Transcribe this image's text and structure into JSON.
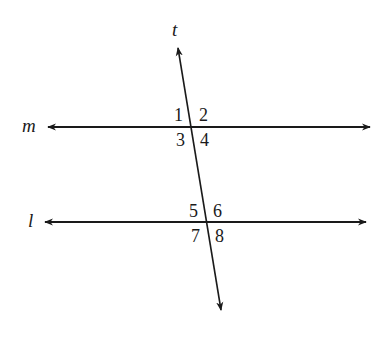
{
  "diagram": {
    "type": "parallel-lines-cut-by-transversal",
    "stroke_color": "#1a1a1a",
    "background": "#ffffff",
    "lines": {
      "transversal": {
        "name": "t"
      },
      "upper": {
        "name": "m"
      },
      "lower": {
        "name": "l"
      }
    },
    "angles_upper": [
      "1",
      "2",
      "3",
      "4"
    ],
    "angles_lower": [
      "5",
      "6",
      "7",
      "8"
    ]
  }
}
